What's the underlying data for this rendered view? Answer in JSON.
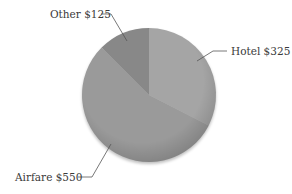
{
  "chart_data": {
    "type": "pie",
    "title": "",
    "categories": [
      "Hotel",
      "Airfare",
      "Other"
    ],
    "values": [
      325,
      550,
      125
    ],
    "labels": [
      "Hotel $325",
      "Airfare $550",
      "Other $125"
    ],
    "colors": [
      "#a5a5a5",
      "#9a9a9a",
      "#888888"
    ],
    "start_angle": "12 o'clock, clockwise",
    "legend": "none (leader-line callouts)"
  },
  "callouts": {
    "hotel": "Hotel $325",
    "airfare": "Airfare $550",
    "other": "Other $125"
  }
}
